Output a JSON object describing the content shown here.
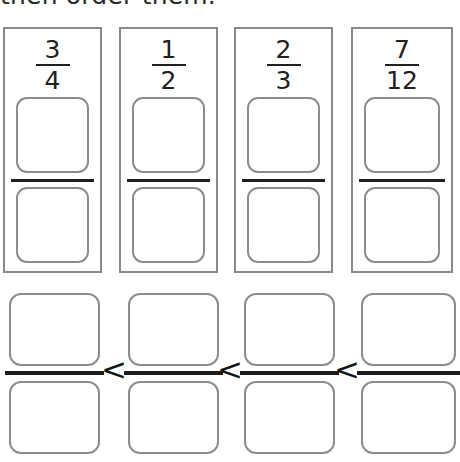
{
  "worksheet": {
    "instruction": "then order them.",
    "fraction_cards": [
      {
        "name": "card-three-quarters",
        "numerator": "3",
        "denominator": "4",
        "value": 0.75
      },
      {
        "name": "card-one-half",
        "numerator": "1",
        "denominator": "2",
        "value": 0.5
      },
      {
        "name": "card-two-thirds",
        "numerator": "2",
        "denominator": "3",
        "value": 0.6667
      },
      {
        "name": "card-seven-twelfths",
        "numerator": "7",
        "denominator": "12",
        "value": 0.5833
      }
    ],
    "answer_row": {
      "slots": [
        {
          "numerator": "",
          "denominator": ""
        },
        {
          "numerator": "",
          "denominator": ""
        },
        {
          "numerator": "",
          "denominator": ""
        },
        {
          "numerator": "",
          "denominator": ""
        }
      ],
      "operators": [
        "<",
        "<",
        "<"
      ]
    }
  }
}
